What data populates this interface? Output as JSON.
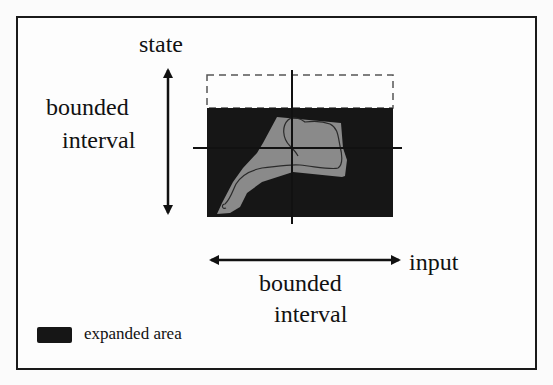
{
  "figure": {
    "labels": {
      "y_axis": "state",
      "y_interval": [
        "bounded",
        "interval"
      ],
      "x_axis": "input",
      "x_interval": [
        "bounded",
        "interval"
      ]
    },
    "legend": {
      "items": [
        {
          "label": "expanded area",
          "color": "#161616"
        }
      ]
    },
    "colors": {
      "expanded_area": "#161616",
      "operating_region": "#8a8a8a",
      "trajectory": "#2a2a2a",
      "axes": "#111111",
      "dashed_bound": "#555555",
      "frame": "#1a1a1a"
    }
  }
}
